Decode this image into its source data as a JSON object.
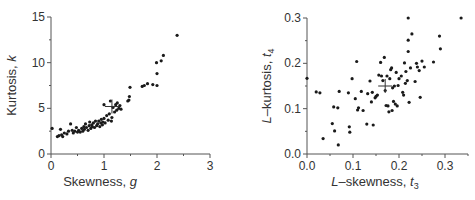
{
  "chart_data": [
    {
      "type": "scatter",
      "title": "",
      "xlabel": "Skewness, g",
      "ylabel": "Kurtosis, k",
      "xlabel_text": "Skewness, ",
      "xlabel_var": "g",
      "ylabel_text": "Kurtosis, ",
      "ylabel_var": "k",
      "xlim": [
        0,
        3
      ],
      "ylim": [
        0,
        15
      ],
      "xticks": [
        0,
        1,
        2,
        3
      ],
      "yticks": [
        0,
        5,
        10,
        15
      ],
      "xtick_labels": [
        "0",
        "1",
        "2",
        "3"
      ],
      "ytick_labels": [
        "0",
        "5",
        "10",
        "15"
      ],
      "grid": false,
      "legend": null,
      "mean_marker": {
        "x": 1.15,
        "y": 5.2
      },
      "points": [
        [
          0.02,
          2.8
        ],
        [
          0.12,
          1.9
        ],
        [
          0.15,
          2.0
        ],
        [
          0.18,
          2.7
        ],
        [
          0.2,
          2.1
        ],
        [
          0.22,
          1.9
        ],
        [
          0.25,
          2.3
        ],
        [
          0.3,
          2.2
        ],
        [
          0.33,
          2.5
        ],
        [
          0.37,
          3.3
        ],
        [
          0.4,
          2.6
        ],
        [
          0.42,
          2.3
        ],
        [
          0.45,
          2.5
        ],
        [
          0.48,
          2.9
        ],
        [
          0.5,
          2.4
        ],
        [
          0.52,
          2.6
        ],
        [
          0.55,
          2.4
        ],
        [
          0.58,
          2.8
        ],
        [
          0.6,
          2.5
        ],
        [
          0.62,
          3.0
        ],
        [
          0.63,
          2.7
        ],
        [
          0.65,
          3.3
        ],
        [
          0.67,
          2.9
        ],
        [
          0.7,
          2.6
        ],
        [
          0.72,
          3.1
        ],
        [
          0.73,
          3.5
        ],
        [
          0.75,
          2.8
        ],
        [
          0.77,
          3.2
        ],
        [
          0.78,
          3.0
        ],
        [
          0.8,
          3.4
        ],
        [
          0.82,
          2.9
        ],
        [
          0.84,
          3.6
        ],
        [
          0.86,
          3.1
        ],
        [
          0.88,
          3.3
        ],
        [
          0.9,
          3.6
        ],
        [
          0.92,
          3.0
        ],
        [
          0.94,
          3.4
        ],
        [
          0.95,
          3.8
        ],
        [
          0.97,
          3.2
        ],
        [
          0.98,
          3.5
        ],
        [
          1.0,
          3.9
        ],
        [
          1.02,
          3.4
        ],
        [
          1.0,
          5.4
        ],
        [
          1.05,
          4.2
        ],
        [
          1.08,
          3.7
        ],
        [
          1.1,
          4.4
        ],
        [
          1.12,
          5.8
        ],
        [
          1.14,
          3.6
        ],
        [
          1.15,
          4.0
        ],
        [
          1.17,
          5.1
        ],
        [
          1.2,
          4.6
        ],
        [
          1.22,
          5.4
        ],
        [
          1.24,
          4.8
        ],
        [
          1.25,
          5.6
        ],
        [
          1.28,
          5.0
        ],
        [
          1.3,
          5.3
        ],
        [
          1.32,
          4.9
        ],
        [
          1.45,
          5.8
        ],
        [
          1.47,
          5.9
        ],
        [
          1.48,
          6.3
        ],
        [
          1.49,
          7.3
        ],
        [
          1.72,
          7.4
        ],
        [
          1.76,
          7.5
        ],
        [
          1.82,
          7.7
        ],
        [
          1.92,
          7.6
        ],
        [
          2.0,
          7.5
        ],
        [
          1.99,
          10.0
        ],
        [
          2.0,
          8.8
        ],
        [
          2.08,
          10.2
        ],
        [
          2.12,
          10.8
        ],
        [
          2.38,
          13.0
        ]
      ]
    },
    {
      "type": "scatter",
      "title": "",
      "xlabel": "L-skewness, t3",
      "ylabel": "L-kurtosis, t4",
      "xlabel_text": "–skewness, ",
      "xlabel_var": "t",
      "xlabel_sub": "3",
      "ylabel_text": "–kurtosis, ",
      "ylabel_var": "t",
      "ylabel_sub": "4",
      "label_prefix": "L",
      "xlim": [
        0,
        0.35
      ],
      "ylim": [
        0,
        0.3
      ],
      "xticks": [
        0.0,
        0.1,
        0.2,
        0.3
      ],
      "yticks": [
        0.0,
        0.1,
        0.2,
        0.3
      ],
      "xtick_labels": [
        "0.0",
        "0.1",
        "0.2",
        "0.3"
      ],
      "ytick_labels": [
        "0.0",
        "0.1",
        "0.2",
        "0.3"
      ],
      "grid": false,
      "legend": null,
      "mean_marker": {
        "x": 0.17,
        "y": 0.15
      },
      "points": [
        [
          0.0,
          0.167
        ],
        [
          0.02,
          0.137
        ],
        [
          0.028,
          0.135
        ],
        [
          0.035,
          0.034
        ],
        [
          0.055,
          0.067
        ],
        [
          0.058,
          0.104
        ],
        [
          0.06,
          0.051
        ],
        [
          0.067,
          0.102
        ],
        [
          0.068,
          0.02
        ],
        [
          0.07,
          0.138
        ],
        [
          0.09,
          0.135
        ],
        [
          0.092,
          0.06
        ],
        [
          0.093,
          0.048
        ],
        [
          0.098,
          0.166
        ],
        [
          0.105,
          0.122
        ],
        [
          0.108,
          0.204
        ],
        [
          0.11,
          0.097
        ],
        [
          0.112,
          0.102
        ],
        [
          0.118,
          0.138
        ],
        [
          0.122,
          0.096
        ],
        [
          0.13,
          0.066
        ],
        [
          0.132,
          0.133
        ],
        [
          0.137,
          0.161
        ],
        [
          0.14,
          0.115
        ],
        [
          0.142,
          0.136
        ],
        [
          0.144,
          0.064
        ],
        [
          0.148,
          0.124
        ],
        [
          0.15,
          0.127
        ],
        [
          0.153,
          0.13
        ],
        [
          0.156,
          0.174
        ],
        [
          0.16,
          0.202
        ],
        [
          0.162,
          0.172
        ],
        [
          0.165,
          0.162
        ],
        [
          0.168,
          0.213
        ],
        [
          0.17,
          0.14
        ],
        [
          0.172,
          0.107
        ],
        [
          0.174,
          0.172
        ],
        [
          0.176,
          0.106
        ],
        [
          0.178,
          0.093
        ],
        [
          0.18,
          0.166
        ],
        [
          0.182,
          0.186
        ],
        [
          0.184,
          0.19
        ],
        [
          0.185,
          0.096
        ],
        [
          0.186,
          0.146
        ],
        [
          0.188,
          0.116
        ],
        [
          0.19,
          0.15
        ],
        [
          0.192,
          0.11
        ],
        [
          0.194,
          0.18
        ],
        [
          0.196,
          0.106
        ],
        [
          0.198,
          0.151
        ],
        [
          0.2,
          0.166
        ],
        [
          0.205,
          0.172
        ],
        [
          0.208,
          0.136
        ],
        [
          0.21,
          0.13
        ],
        [
          0.212,
          0.201
        ],
        [
          0.214,
          0.156
        ],
        [
          0.215,
          0.182
        ],
        [
          0.218,
          0.162
        ],
        [
          0.22,
          0.226
        ],
        [
          0.22,
          0.251
        ],
        [
          0.22,
          0.3
        ],
        [
          0.222,
          0.114
        ],
        [
          0.225,
          0.19
        ],
        [
          0.228,
          0.265
        ],
        [
          0.235,
          0.16
        ],
        [
          0.238,
          0.2
        ],
        [
          0.24,
          0.192
        ],
        [
          0.244,
          0.184
        ],
        [
          0.246,
          0.125
        ],
        [
          0.25,
          0.205
        ],
        [
          0.255,
          0.192
        ],
        [
          0.275,
          0.203
        ],
        [
          0.288,
          0.26
        ],
        [
          0.29,
          0.232
        ],
        [
          0.335,
          0.3
        ]
      ]
    }
  ]
}
